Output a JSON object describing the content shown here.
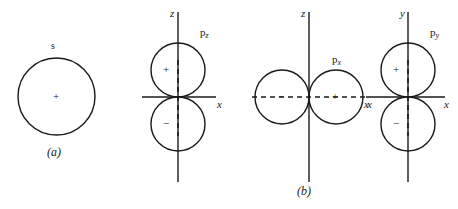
{
  "figure": {
    "caption_a": "(a)",
    "caption_b": "(b)",
    "background_color": "#ffffff",
    "line_color": "#1a1a1a"
  },
  "panels": [
    {
      "id": "s-orbital",
      "label": "s",
      "caption": "(a)",
      "lobes": [
        {
          "sign": "+",
          "position": "center"
        }
      ],
      "axes": []
    },
    {
      "id": "pz-orbital",
      "label_base": "p",
      "label_sub": "z",
      "lobes": [
        {
          "sign": "+",
          "position": "upper"
        },
        {
          "sign": "−",
          "position": "lower"
        }
      ],
      "axes": [
        {
          "name": "z",
          "orientation": "vertical",
          "style": "solid"
        },
        {
          "name": "x",
          "orientation": "horizontal",
          "style": "solid"
        }
      ],
      "nodal_axis": {
        "name": "z",
        "style": "dashed"
      }
    },
    {
      "id": "px-orbital",
      "label_base": "p",
      "label_sub": "x",
      "caption": "(b)",
      "lobes": [
        {
          "sign": "−",
          "position": "left"
        },
        {
          "sign": "+",
          "position": "right"
        }
      ],
      "axes": [
        {
          "name": "z",
          "orientation": "vertical",
          "style": "solid"
        },
        {
          "name": "x",
          "orientation": "horizontal",
          "style": "dashed"
        }
      ],
      "nodal_axis": {
        "name": "x",
        "style": "dashed"
      }
    },
    {
      "id": "py-orbital",
      "label_base": "p",
      "label_sub": "y",
      "lobes": [
        {
          "sign": "+",
          "position": "upper"
        },
        {
          "sign": "−",
          "position": "lower"
        }
      ],
      "axes": [
        {
          "name": "y",
          "orientation": "vertical",
          "style": "solid"
        },
        {
          "name": "x",
          "orientation": "horizontal-left",
          "style": "solid"
        },
        {
          "name": "x",
          "orientation": "horizontal-right",
          "style": "solid"
        }
      ],
      "nodal_axis": {
        "name": "y",
        "style": "dashed"
      }
    }
  ],
  "labels": {
    "s": "s",
    "p": "p",
    "sub_z": "z",
    "sub_x": "x",
    "sub_y": "y",
    "axis_z": "z",
    "axis_x": "x",
    "axis_y": "y",
    "plus": "+",
    "minus": "−",
    "caption_a": "(a)",
    "caption_b": "(b)"
  }
}
